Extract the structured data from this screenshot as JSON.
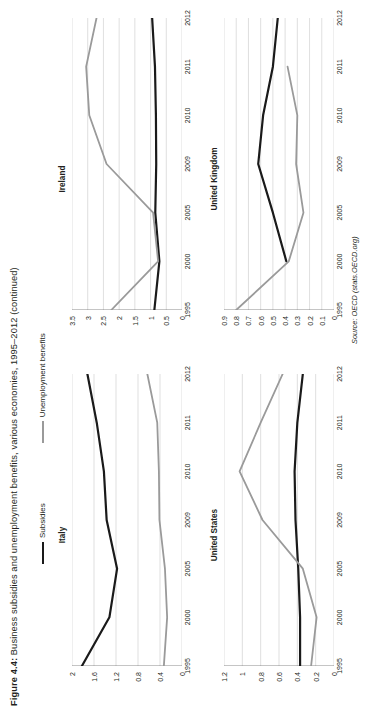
{
  "figure": {
    "label": "Figure 4.4:",
    "caption": "Business subsidies and unemployment benefits, various economies, 1995–2012 (continued)",
    "source": "Source: OECD (stats.OECD.org)"
  },
  "legend": {
    "position": "top",
    "items": [
      {
        "label": "Subsidies",
        "color": "#1a1a1a"
      },
      {
        "label": "Unemployment benefits",
        "color": "#9a9a9a"
      }
    ]
  },
  "colors": {
    "subsidies": "#1a1a1a",
    "unemployment": "#9a9a9a",
    "gridline": "#c9c9c9",
    "axis": "#6d6d6d",
    "text": "#231f20"
  },
  "chart_data": [
    {
      "type": "line",
      "title": "Italy",
      "xlabel": "",
      "ylabel": "",
      "grid": true,
      "legend_position": "top",
      "x": [
        "1995",
        "2000",
        "2005",
        "2009",
        "2010",
        "2011",
        "2012"
      ],
      "xticklabels": [
        "1995",
        "2000",
        "2005",
        "2009",
        "2010",
        "2011",
        "2012"
      ],
      "yticklabels": [
        "0",
        "0.4",
        "0.8",
        "1.2",
        "1.6",
        "2"
      ],
      "ylim": [
        0,
        2
      ],
      "series": [
        {
          "name": "Subsidies",
          "color": "#1a1a1a",
          "values": [
            1.82,
            1.32,
            1.18,
            1.37,
            1.42,
            1.55,
            1.72
          ]
        },
        {
          "name": "Unemployment benefits",
          "color": "#9a9a9a",
          "values": [
            0.33,
            0.27,
            0.31,
            0.41,
            0.42,
            0.45,
            0.63
          ]
        }
      ]
    },
    {
      "type": "line",
      "title": "Ireland",
      "xlabel": "",
      "ylabel": "",
      "grid": true,
      "legend_position": "top",
      "x": [
        "1995",
        "2000",
        "2005",
        "2009",
        "2010",
        "2011",
        "2012"
      ],
      "xticklabels": [
        "1995",
        "2000",
        "2005",
        "2009",
        "2010",
        "2011",
        "2012"
      ],
      "yticklabels": [
        "0",
        "0.5",
        "1",
        "1.5",
        "2",
        "2.5",
        "3",
        "3.5"
      ],
      "ylim": [
        0,
        3.5
      ],
      "series": [
        {
          "name": "Subsidies",
          "color": "#1a1a1a",
          "values": [
            0.88,
            0.72,
            0.85,
            0.82,
            0.83,
            0.86,
            0.95
          ]
        },
        {
          "name": "Unemployment benefits",
          "color": "#9a9a9a",
          "values": [
            2.25,
            0.76,
            0.92,
            2.4,
            2.95,
            3.05,
            2.72
          ]
        }
      ]
    },
    {
      "type": "line",
      "title": "United States",
      "xlabel": "",
      "ylabel": "",
      "grid": true,
      "legend_position": "top",
      "x": [
        "1995",
        "2000",
        "2005",
        "2009",
        "2010",
        "2011",
        "2012"
      ],
      "xticklabels": [
        "1995",
        "2000",
        "2005",
        "2009",
        "2010",
        "2011",
        "2012"
      ],
      "yticklabels": [
        "0",
        "0.2",
        "0.4",
        "0.6",
        "0.8",
        "1",
        "1.2"
      ],
      "ylim": [
        0,
        1.2
      ],
      "series": [
        {
          "name": "Subsidies",
          "color": "#1a1a1a",
          "values": [
            0.37,
            0.37,
            0.39,
            0.42,
            0.43,
            0.4,
            0.34
          ]
        },
        {
          "name": "Unemployment benefits",
          "color": "#9a9a9a",
          "values": [
            0.25,
            0.19,
            0.34,
            0.78,
            1.03,
            0.8,
            0.56
          ]
        }
      ]
    },
    {
      "type": "line",
      "title": "United Kingdom",
      "xlabel": "",
      "ylabel": "",
      "grid": true,
      "legend_position": "top",
      "x": [
        "1995",
        "2000",
        "2005",
        "2009",
        "2010",
        "2011",
        "2012"
      ],
      "xticklabels": [
        "1995",
        "2000",
        "2005",
        "2009",
        "2010",
        "2011",
        "2012"
      ],
      "yticklabels": [
        "0",
        "0.1",
        "0.2",
        "0.3",
        "0.4",
        "0.5",
        "0.6",
        "0.7",
        "0.8",
        "0.9"
      ],
      "ylim": [
        0,
        0.9
      ],
      "series": [
        {
          "name": "Subsidies",
          "color": "#1a1a1a",
          "values": [
            null,
            0.39,
            0.5,
            0.62,
            0.58,
            0.5,
            0.46
          ]
        },
        {
          "name": "Unemployment benefits",
          "color": "#9a9a9a",
          "values": [
            0.8,
            0.37,
            0.25,
            0.31,
            0.3,
            0.38,
            null
          ]
        }
      ]
    }
  ]
}
